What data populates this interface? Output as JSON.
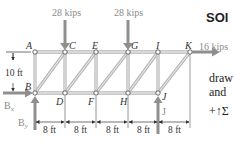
{
  "diagram": {
    "type": "truss",
    "nodes": {
      "top": [
        "A",
        "C",
        "E",
        "G",
        "I",
        "K"
      ],
      "bottom": [
        "B",
        "D",
        "F",
        "H",
        "J"
      ]
    },
    "loads": [
      {
        "node": "C",
        "label": "28 kips",
        "direction": "down"
      },
      {
        "node": "G",
        "label": "28 kips",
        "direction": "down"
      },
      {
        "node": "K",
        "label": "16 kips",
        "direction": "right"
      }
    ],
    "reactions": [
      {
        "node": "B",
        "label": "B",
        "sub": "x",
        "direction": "right"
      },
      {
        "node": "B",
        "label": "B",
        "sub": "y",
        "direction": "up"
      },
      {
        "node": "J",
        "label": "J",
        "direction": "up"
      }
    ],
    "height_dim": "10 ft",
    "span_dims": [
      "8 ft",
      "8 ft",
      "8 ft",
      "8 ft",
      "8 ft"
    ],
    "colors": {
      "member": "#c8c8c8",
      "member_edge": "#9a9a9a",
      "arrow": "#8f8f8f",
      "text": "#333333"
    }
  },
  "side_text": {
    "heading": "SOl",
    "line1": "draw",
    "line2": "and",
    "line3": "+↑Σ"
  }
}
